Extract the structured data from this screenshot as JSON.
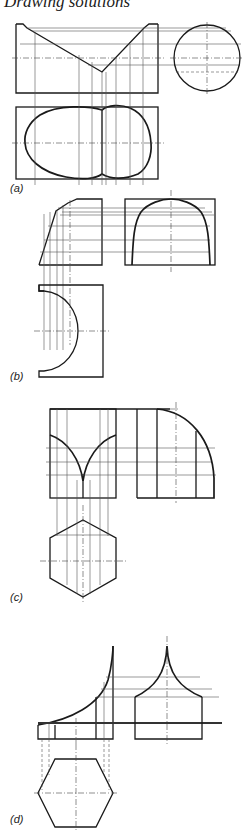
{
  "page": {
    "running_header": "Drawing solutions"
  },
  "figures": [
    {
      "id": "a",
      "label": "(a)",
      "description": "Cylinder cut by V-shaped planes: front elevation, end view (circle) and plan (lobed outline)"
    },
    {
      "id": "b",
      "label": "(b)",
      "description": "Truncated solid: elevation, end elevation with curved profile and plan with semicircular cut-out"
    },
    {
      "id": "c",
      "label": "(c)",
      "description": "Hexagonal prism intersections: elevation with curved cusp, end elevation with quarter-arc, hexagonal plan"
    },
    {
      "id": "d",
      "label": "(d)",
      "description": "Hexagonal solid with concave curved top: elevation, end elevation with cusp peak, hexagonal plan"
    }
  ]
}
